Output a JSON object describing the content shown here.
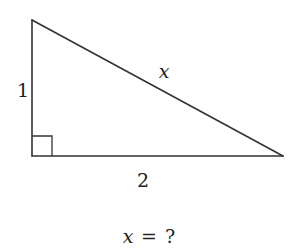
{
  "figure": {
    "type": "right-triangle",
    "stroke_color": "#333333",
    "background": "#ffffff",
    "vertices": {
      "top": [
        32,
        20
      ],
      "right_angle": [
        32,
        156
      ],
      "right": [
        283,
        156
      ]
    },
    "right_angle_marker_size": 20,
    "labels": {
      "vertical_leg": "1",
      "horizontal_leg": "2",
      "hypotenuse": "x"
    }
  },
  "question": {
    "variable": "x",
    "equals": "=",
    "unknown": "?"
  }
}
